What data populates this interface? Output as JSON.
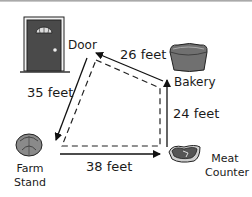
{
  "diagram": {
    "locations": [
      {
        "id": "door",
        "label": "Door"
      },
      {
        "id": "bakery",
        "label": "Bakery"
      },
      {
        "id": "meat",
        "label_line1": "Meat",
        "label_line2": "Counter"
      },
      {
        "id": "farm",
        "label_line1": "Farm",
        "label_line2": "Stand"
      }
    ],
    "edges": [
      {
        "from": "door",
        "to": "farm",
        "distance": "35 feet"
      },
      {
        "from": "bakery",
        "to": "door",
        "distance": "26 feet"
      },
      {
        "from": "meat",
        "to": "bakery",
        "distance": "24 feet"
      },
      {
        "from": "farm",
        "to": "meat",
        "distance": "38 feet"
      }
    ],
    "colors": {
      "door": "#4a4a4a",
      "bakery": "#707070",
      "meat": "#555555",
      "farm": "#8a8a8a",
      "line": "#111111"
    }
  }
}
